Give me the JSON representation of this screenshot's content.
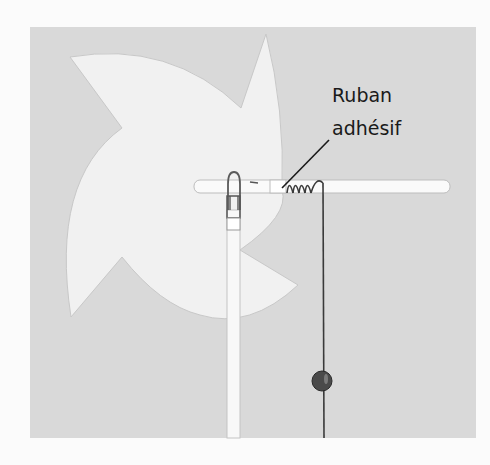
{
  "figure": {
    "label": {
      "line1": "Ruban",
      "line2": "adhésif"
    },
    "colors": {
      "page_background": "#fbfbfb",
      "panel_background": "#d9d9d9",
      "pinwheel_fill": "#f1f1f1",
      "straw_fill": "#fafafa",
      "thread": "#3a3a3a",
      "bead": "#4a4a4a",
      "label_text": "#1a1a1a"
    }
  }
}
